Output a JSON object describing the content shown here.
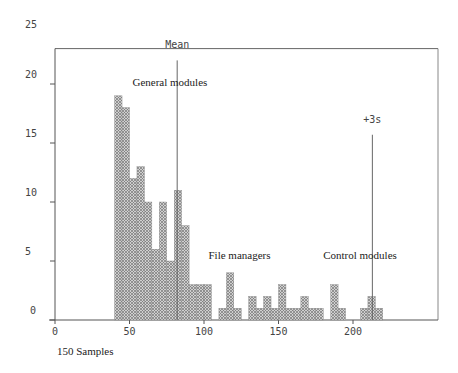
{
  "chart_data": {
    "type": "bar",
    "subtype": "histogram",
    "title": "",
    "xlabel": "150 Samples",
    "ylabel": "",
    "xlim": [
      0,
      250
    ],
    "ylim": [
      0,
      25
    ],
    "x_ticks": [
      0,
      50,
      100,
      150,
      200
    ],
    "y_ticks": [
      0,
      5,
      10,
      15,
      20,
      25
    ],
    "bin_width": 5,
    "bins": [
      {
        "x": 40,
        "count": 19
      },
      {
        "x": 45,
        "count": 18
      },
      {
        "x": 50,
        "count": 12
      },
      {
        "x": 55,
        "count": 13
      },
      {
        "x": 60,
        "count": 10
      },
      {
        "x": 65,
        "count": 6
      },
      {
        "x": 70,
        "count": 10
      },
      {
        "x": 75,
        "count": 5
      },
      {
        "x": 80,
        "count": 11
      },
      {
        "x": 85,
        "count": 8
      },
      {
        "x": 90,
        "count": 3
      },
      {
        "x": 95,
        "count": 3
      },
      {
        "x": 100,
        "count": 3
      },
      {
        "x": 110,
        "count": 1
      },
      {
        "x": 115,
        "count": 4
      },
      {
        "x": 120,
        "count": 1
      },
      {
        "x": 130,
        "count": 2
      },
      {
        "x": 135,
        "count": 1
      },
      {
        "x": 140,
        "count": 2
      },
      {
        "x": 145,
        "count": 1
      },
      {
        "x": 150,
        "count": 3
      },
      {
        "x": 155,
        "count": 1
      },
      {
        "x": 160,
        "count": 1
      },
      {
        "x": 165,
        "count": 2
      },
      {
        "x": 170,
        "count": 1
      },
      {
        "x": 175,
        "count": 1
      },
      {
        "x": 185,
        "count": 3
      },
      {
        "x": 190,
        "count": 1
      },
      {
        "x": 205,
        "count": 1
      },
      {
        "x": 210,
        "count": 2
      },
      {
        "x": 215,
        "count": 1
      }
    ],
    "reference_lines": [
      {
        "label": "Mean",
        "x": 82,
        "top": 22
      },
      {
        "label": "+3s",
        "x": 213,
        "top": 15.7
      }
    ],
    "annotations": [
      {
        "text": "General  modules",
        "x": 52,
        "y": 19.8
      },
      {
        "text": "File managers",
        "x": 103,
        "y": 5.2
      },
      {
        "text": "Control  modules",
        "x": 180,
        "y": 5.2
      }
    ],
    "grid": false,
    "legend": null,
    "colors": {
      "bar_fill": "#b8b8b8",
      "bar_pattern": "#7a7a7a",
      "axis": "#555555",
      "ref_line": "#666666"
    }
  }
}
